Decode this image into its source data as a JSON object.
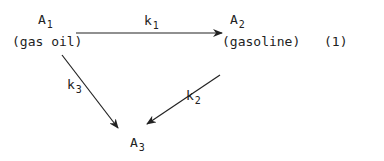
{
  "nodes": {
    "a1": {
      "symbol": "A",
      "sub": "1",
      "name": "(gas oil)"
    },
    "a2": {
      "symbol": "A",
      "sub": "2",
      "name": "(gasoline)"
    },
    "a3": {
      "symbol": "A",
      "sub": "3"
    }
  },
  "rates": {
    "k1": {
      "symbol": "k",
      "sub": "1"
    },
    "k2": {
      "symbol": "k",
      "sub": "2"
    },
    "k3": {
      "symbol": "k",
      "sub": "3"
    }
  },
  "equation_number": "(1)"
}
